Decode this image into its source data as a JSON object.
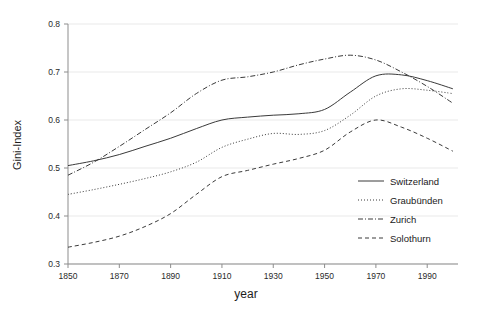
{
  "chart_data": {
    "type": "line",
    "title": "",
    "xlabel": "year",
    "ylabel": "Gini-Index",
    "xlim": [
      1850,
      2002
    ],
    "ylim": [
      0.3,
      0.8
    ],
    "grid": true,
    "legend_position": "bottom-right",
    "xticks": [
      1850,
      1870,
      1890,
      1910,
      1930,
      1950,
      1970,
      1990
    ],
    "xtick_labels": [
      "1850",
      "1870",
      "1890",
      "1910",
      "1930",
      "1950",
      "1970",
      "1990"
    ],
    "yticks": [
      0.3,
      0.4,
      0.5,
      0.6,
      0.7,
      0.8
    ],
    "ytick_labels": [
      "0.3",
      "0.4",
      "0.5",
      "0.6",
      "0.7",
      "0.8"
    ],
    "x": [
      1850,
      1860,
      1870,
      1880,
      1890,
      1900,
      1910,
      1920,
      1930,
      1940,
      1950,
      1960,
      1970,
      1980,
      1990,
      2000
    ],
    "series": [
      {
        "name": "Switzerland",
        "style": "solid",
        "dasharray": "",
        "values": [
          0.505,
          0.515,
          0.528,
          0.545,
          0.562,
          0.582,
          0.6,
          0.606,
          0.61,
          0.613,
          0.622,
          0.658,
          0.692,
          0.694,
          0.682,
          0.665
        ]
      },
      {
        "name": "Graubünden",
        "style": "dotted",
        "dasharray": "1,2",
        "values": [
          0.445,
          0.455,
          0.466,
          0.478,
          0.492,
          0.512,
          0.543,
          0.56,
          0.572,
          0.57,
          0.578,
          0.61,
          0.65,
          0.665,
          0.662,
          0.655
        ]
      },
      {
        "name": "Zurich",
        "style": "dash-dot",
        "dasharray": "5,2,1,2",
        "values": [
          0.485,
          0.512,
          0.545,
          0.58,
          0.615,
          0.655,
          0.683,
          0.69,
          0.7,
          0.715,
          0.727,
          0.735,
          0.725,
          0.7,
          0.67,
          0.635
        ]
      },
      {
        "name": "Solothurn",
        "style": "dashed",
        "dasharray": "4,3",
        "values": [
          0.335,
          0.345,
          0.358,
          0.378,
          0.405,
          0.445,
          0.482,
          0.495,
          0.508,
          0.52,
          0.537,
          0.575,
          0.6,
          0.585,
          0.562,
          0.535
        ]
      }
    ]
  },
  "legend": {
    "items": [
      {
        "label": "Switzerland"
      },
      {
        "label": "Graubünden"
      },
      {
        "label": "Zurich"
      },
      {
        "label": "Solothurn"
      }
    ]
  }
}
